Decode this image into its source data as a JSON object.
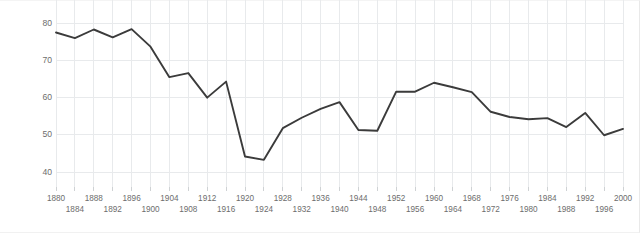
{
  "chart_data": {
    "type": "line",
    "title": "",
    "subtitle": "",
    "xlabel": "",
    "ylabel": "Percentage of voting-age population participating",
    "xlim": [
      1880,
      2000
    ],
    "ylim": [
      36,
      83
    ],
    "yticks": [
      40,
      50,
      60,
      70,
      80
    ],
    "grid": true,
    "legend": false,
    "legend_position": "none",
    "line_color": "#3b3b3b",
    "grid_color": "#e8eaec",
    "tick_label_color": "#6d6d6d",
    "x": [
      1880,
      1884,
      1888,
      1892,
      1896,
      1900,
      1904,
      1908,
      1912,
      1916,
      1920,
      1924,
      1928,
      1932,
      1936,
      1940,
      1944,
      1948,
      1952,
      1956,
      1960,
      1964,
      1968,
      1972,
      1976,
      1980,
      1984,
      1988,
      1992,
      1996,
      2000
    ],
    "values": [
      77.5,
      76.0,
      78.3,
      76.2,
      78.4,
      73.7,
      65.5,
      66.6,
      60.0,
      64.3,
      44.2,
      43.3,
      51.8,
      54.6,
      57.0,
      58.8,
      51.3,
      51.1,
      61.6,
      61.6,
      64.0,
      62.8,
      61.5,
      56.2,
      54.8,
      54.2,
      54.5,
      52.1,
      55.9,
      49.9,
      51.6
    ],
    "annotations": []
  },
  "xticks": {
    "row0": [
      {
        "label": "1880",
        "value": 1880
      },
      {
        "label": "1888",
        "value": 1888
      },
      {
        "label": "1896",
        "value": 1896
      },
      {
        "label": "1904",
        "value": 1904
      },
      {
        "label": "1912",
        "value": 1912
      },
      {
        "label": "1920",
        "value": 1920
      },
      {
        "label": "1928",
        "value": 1928
      },
      {
        "label": "1936",
        "value": 1936
      },
      {
        "label": "1944",
        "value": 1944
      },
      {
        "label": "1952",
        "value": 1952
      },
      {
        "label": "1960",
        "value": 1960
      },
      {
        "label": "1968",
        "value": 1968
      },
      {
        "label": "1976",
        "value": 1976
      },
      {
        "label": "1984",
        "value": 1984
      },
      {
        "label": "1992",
        "value": 1992
      },
      {
        "label": "2000",
        "value": 2000
      }
    ],
    "row1": [
      {
        "label": "1884",
        "value": 1884
      },
      {
        "label": "1892",
        "value": 1892
      },
      {
        "label": "1900",
        "value": 1900
      },
      {
        "label": "1908",
        "value": 1908
      },
      {
        "label": "1916",
        "value": 1916
      },
      {
        "label": "1924",
        "value": 1924
      },
      {
        "label": "1932",
        "value": 1932
      },
      {
        "label": "1940",
        "value": 1940
      },
      {
        "label": "1948",
        "value": 1948
      },
      {
        "label": "1956",
        "value": 1956
      },
      {
        "label": "1964",
        "value": 1964
      },
      {
        "label": "1972",
        "value": 1972
      },
      {
        "label": "1980",
        "value": 1980
      },
      {
        "label": "1988",
        "value": 1988
      },
      {
        "label": "1996",
        "value": 1996
      }
    ]
  }
}
